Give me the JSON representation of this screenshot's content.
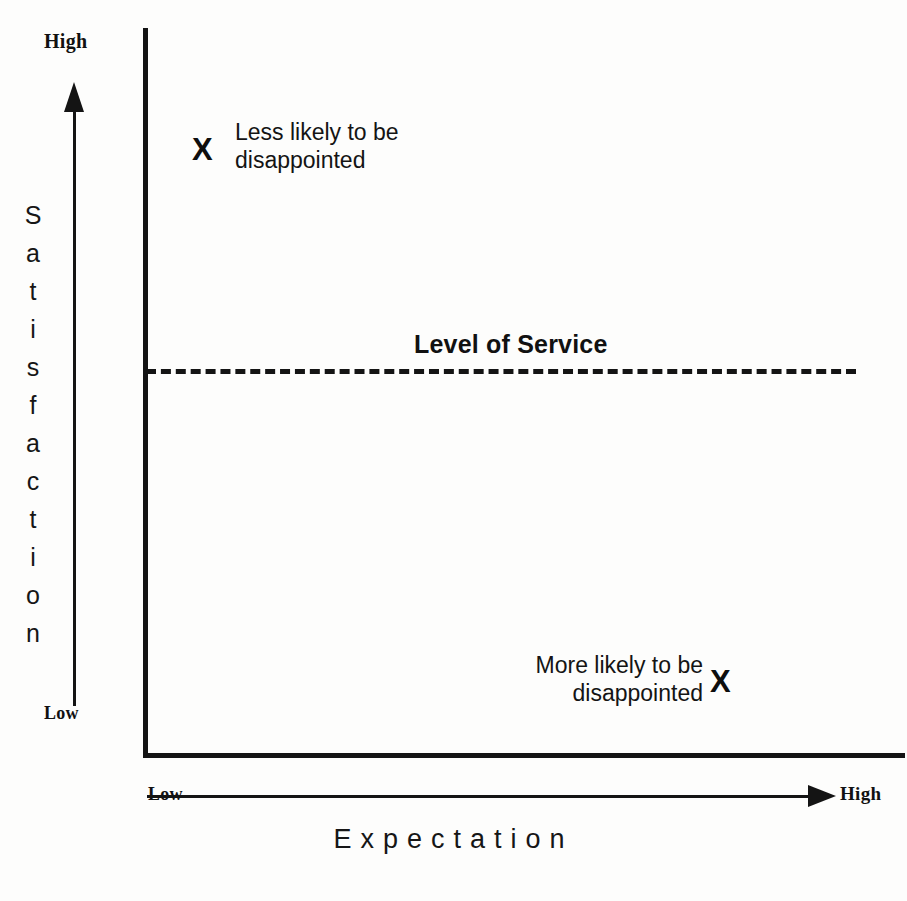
{
  "chart_data": {
    "type": "scatter",
    "title": "",
    "xlabel": "Expectation",
    "ylabel": "Satisfaction",
    "x_axis": {
      "title": "Expectation",
      "low_label": "Low",
      "high_label": "High",
      "direction": "left-to-right increasing"
    },
    "y_axis": {
      "title": "Satisfaction",
      "low_label": "Low",
      "high_label": "High",
      "direction": "bottom-to-top increasing"
    },
    "reference_lines": [
      {
        "label": "Level of Service",
        "style": "dashed",
        "orientation": "horizontal",
        "y_fraction": 0.53
      }
    ],
    "points": [
      {
        "marker": "X",
        "label": "Less likely to be disappointed",
        "x_qualitative": "Low",
        "y_qualitative": "High",
        "x_fraction": 0.08,
        "y_fraction": 0.84
      },
      {
        "marker": "X",
        "label": "More likely to be disappointed",
        "x_qualitative": "High",
        "y_qualitative": "Low",
        "x_fraction": 0.76,
        "y_fraction": 0.1
      }
    ],
    "grid": false,
    "legend": false,
    "colors": {
      "ink": "#141414",
      "background": "#fdfdfc"
    }
  },
  "axes": {
    "y": {
      "title_letters": [
        "S",
        "a",
        "t",
        "i",
        "s",
        "f",
        "a",
        "c",
        "t",
        "i",
        "o",
        "n"
      ],
      "high_label": "High",
      "low_label": "Low"
    },
    "x": {
      "title": "Expectation",
      "high_label": "High",
      "low_label": "Low"
    }
  },
  "threshold": {
    "label": "Level of Service"
  },
  "annotations": {
    "top": {
      "marker": "X",
      "line1": "Less likely to be",
      "line2": "disappointed"
    },
    "bottom": {
      "marker": "X",
      "line1": "More likely to be",
      "line2": "disappointed"
    }
  }
}
